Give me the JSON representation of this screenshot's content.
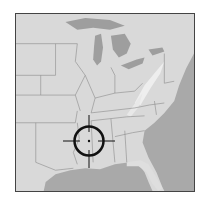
{
  "map": {
    "region": "Eastern United States",
    "style": "grayscale shaded relief",
    "colors": {
      "land": "#d9d9d9",
      "land_light": "#e6e6e6",
      "water": "#a9a9a9",
      "lake": "#9e9e9e",
      "border": "#8a8a8a",
      "frame": "#444444",
      "crosshair": "#111111"
    }
  },
  "marker": {
    "type": "crosshair-target",
    "center_x": 89,
    "center_y": 141,
    "radius": 15,
    "location_hint": "Mississippi / Alabama area"
  }
}
